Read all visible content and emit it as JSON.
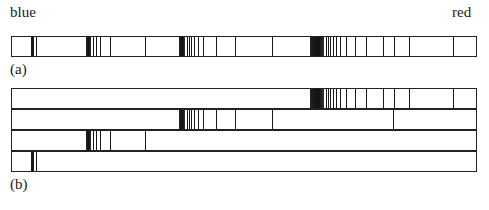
{
  "labels": {
    "blue": "blue",
    "red": "red",
    "panel_a": "(a)",
    "panel_b": "(b)"
  },
  "figure": {
    "bar_a": {
      "x": 11,
      "y": 36,
      "w": 466,
      "h": 21,
      "dark_regions": [
        [
          31,
          3
        ],
        [
          86,
          5
        ],
        [
          179,
          6
        ],
        [
          310,
          14
        ]
      ],
      "lines": [
        36,
        93,
        96,
        100,
        110,
        145,
        187,
        189,
        191,
        194,
        198,
        203,
        216,
        235,
        272,
        326,
        328,
        330,
        333,
        336,
        340,
        346,
        355,
        366,
        383,
        394,
        409,
        453
      ]
    },
    "bar_b_rows": [
      {
        "x": 11,
        "y": 88,
        "w": 466,
        "h": 21,
        "dark_regions": [
          [
            310,
            14
          ]
        ],
        "lines": [
          326,
          328,
          330,
          333,
          336,
          340,
          346,
          355,
          366,
          383,
          394,
          409,
          453
        ]
      },
      {
        "x": 11,
        "y": 109,
        "w": 466,
        "h": 21,
        "dark_regions": [
          [
            179,
            6
          ]
        ],
        "lines": [
          187,
          189,
          191,
          194,
          198,
          203,
          216,
          235,
          272,
          393
        ]
      },
      {
        "x": 11,
        "y": 130,
        "w": 466,
        "h": 21,
        "dark_regions": [
          [
            86,
            5
          ]
        ],
        "lines": [
          93,
          96,
          100,
          110,
          145
        ]
      },
      {
        "x": 11,
        "y": 151,
        "w": 466,
        "h": 21,
        "dark_regions": [
          [
            31,
            3
          ]
        ],
        "lines": [
          36
        ]
      }
    ]
  }
}
